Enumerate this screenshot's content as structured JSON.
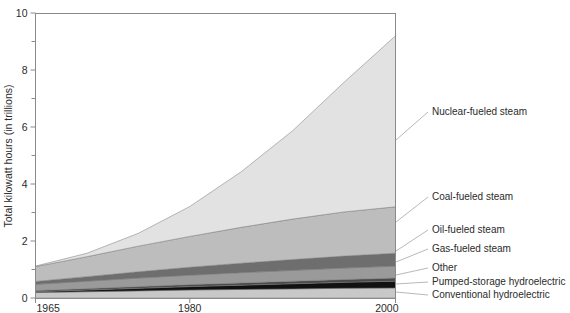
{
  "chart_data": {
    "type": "area",
    "stacked": true,
    "title": "",
    "xlabel": "",
    "ylabel": "Total kilowatt hours (in trillions)",
    "xlim": [
      1965,
      2000
    ],
    "ylim": [
      0,
      10
    ],
    "x": [
      1965,
      1970,
      1975,
      1980,
      1985,
      1990,
      1995,
      2000
    ],
    "xticks": [
      1965,
      1980,
      2000
    ],
    "xtick_labels": [
      "1965",
      "1980",
      "2000"
    ],
    "yticks": [
      0,
      1,
      2,
      3,
      4,
      5,
      6,
      7,
      8,
      9,
      10
    ],
    "ytick_labels": [
      "0",
      "",
      "2",
      "",
      "4",
      "",
      "6",
      "",
      "8",
      "",
      "10"
    ],
    "ytick_major": [
      0,
      2,
      4,
      6,
      8,
      10
    ],
    "grid": false,
    "legend_position": "right-callouts",
    "series": [
      {
        "name": "Conventional hydroelectric",
        "color": "#c8c8c8",
        "values": [
          0.19,
          0.22,
          0.25,
          0.28,
          0.3,
          0.32,
          0.34,
          0.35
        ]
      },
      {
        "name": "Pumped-storage hydroelectric",
        "color": "#111111",
        "values": [
          0.03,
          0.06,
          0.09,
          0.12,
          0.15,
          0.18,
          0.21,
          0.24
        ]
      },
      {
        "name": "Other",
        "color": "#4a4a4a",
        "values": [
          0.04,
          0.05,
          0.06,
          0.07,
          0.08,
          0.09,
          0.1,
          0.11
        ]
      },
      {
        "name": "Gas-fueled steam",
        "color": "#9a9a9a",
        "values": [
          0.22,
          0.26,
          0.3,
          0.33,
          0.36,
          0.38,
          0.4,
          0.42
        ]
      },
      {
        "name": "Oil-fueled steam",
        "color": "#6e6e6e",
        "values": [
          0.1,
          0.16,
          0.22,
          0.28,
          0.33,
          0.38,
          0.42,
          0.45
        ]
      },
      {
        "name": "Coal-fueled steam",
        "color": "#bdbdbd",
        "values": [
          0.52,
          0.7,
          0.9,
          1.08,
          1.26,
          1.42,
          1.55,
          1.63
        ]
      },
      {
        "name": "Nuclear-fueled steam",
        "color": "#e2e2e2",
        "values": [
          0.02,
          0.12,
          0.45,
          1.05,
          1.95,
          3.1,
          4.55,
          6.0
        ]
      }
    ],
    "series_totals_2000": 9.2,
    "annotations": [
      {
        "label": "Nuclear-fueled steam",
        "x": 432,
        "y": 115,
        "anchor_x": 396,
        "anchor_y": 140
      },
      {
        "label": "Coal-fueled steam",
        "x": 432,
        "y": 200,
        "anchor_x": 396,
        "anchor_y": 222
      },
      {
        "label": "Oil-fueled steam",
        "x": 432,
        "y": 233,
        "anchor_x": 396,
        "anchor_y": 251
      },
      {
        "label": "Gas-fueled steam",
        "x": 432,
        "y": 252,
        "anchor_x": 396,
        "anchor_y": 262
      },
      {
        "label": "Other",
        "x": 432,
        "y": 271,
        "anchor_x": 396,
        "anchor_y": 275
      },
      {
        "label": "Pumped-storage hydroelectric",
        "x": 432,
        "y": 285,
        "anchor_x": 396,
        "anchor_y": 284
      },
      {
        "label": "Conventional hydroelectric",
        "x": 432,
        "y": 298,
        "anchor_x": 396,
        "anchor_y": 292
      }
    ]
  },
  "axes": {
    "y_title": "Total kilowatt hours (in trillions)",
    "y_labels": [
      "10",
      "8",
      "6",
      "4",
      "2",
      "0"
    ],
    "x_labels": [
      "1965",
      "1980",
      "2000"
    ]
  },
  "colors": {
    "axis": "#8a8a8a",
    "text": "#2b2b2b",
    "leader": "#9a9a9a",
    "background": "#ffffff"
  }
}
